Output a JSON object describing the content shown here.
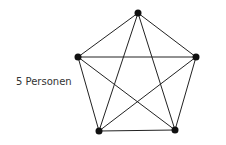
{
  "diagram": {
    "label": "5 Personen",
    "type": "complete-graph",
    "node_count": 5,
    "nodes": [
      {
        "id": "top",
        "x": 138,
        "y": 13
      },
      {
        "id": "right",
        "x": 196,
        "y": 57
      },
      {
        "id": "bottom-right",
        "x": 175,
        "y": 130
      },
      {
        "id": "bottom-left",
        "x": 99,
        "y": 131
      },
      {
        "id": "left",
        "x": 78,
        "y": 57
      }
    ],
    "edge_count": 10,
    "colors": {
      "line": "#222222",
      "node": "#111111",
      "text": "#333333"
    }
  }
}
